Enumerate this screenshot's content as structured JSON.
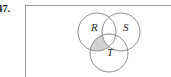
{
  "problem": {
    "number": "47."
  },
  "figure": {
    "caption": "",
    "diagram_type": "venn-three-set",
    "sets": [
      {
        "id": "R",
        "label": "R",
        "position": "upper-left"
      },
      {
        "id": "S",
        "label": "S",
        "position": "upper-right"
      },
      {
        "id": "T",
        "label": "T",
        "position": "lower-center"
      }
    ],
    "shaded_region": {
      "description": "R intersect T, excluding S",
      "fill_color": "#d2d2d2"
    },
    "stroke_color": "#8c8c8c",
    "frame_color": "#9a9a9a",
    "background_color": "#ffffff"
  }
}
